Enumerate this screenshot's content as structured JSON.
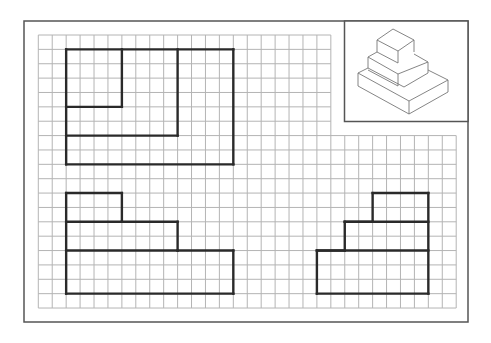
{
  "sheet": {
    "frame": {
      "x": 24,
      "y": 21,
      "width": 444,
      "height": 301,
      "stroke": "#555555"
    },
    "grid": {
      "origin_x": 38.3,
      "origin_y": 35,
      "cell_w": 13.93,
      "cell_h": 14.37,
      "cols": 30,
      "rows": 19,
      "line_color": "#b4b4b4",
      "cutout": {
        "col_start": 22,
        "row_end": 7
      }
    },
    "drawing_line_color": "#2a2a2a",
    "iso_box": {
      "x": 344.5,
      "y": 21,
      "width": 123.5,
      "height": 100.5,
      "stroke": "#555555",
      "line_color": "#777777"
    }
  },
  "views": [
    {
      "name": "top-view",
      "segments_grid": [
        [
          [
            2,
            1
          ],
          [
            14,
            1
          ]
        ],
        [
          [
            14,
            1
          ],
          [
            14,
            9
          ]
        ],
        [
          [
            14,
            9
          ],
          [
            2,
            9
          ]
        ],
        [
          [
            2,
            9
          ],
          [
            2,
            1
          ]
        ],
        [
          [
            6,
            1
          ],
          [
            6,
            5
          ]
        ],
        [
          [
            6,
            5
          ],
          [
            2,
            5
          ]
        ],
        [
          [
            10,
            1
          ],
          [
            10,
            7
          ]
        ],
        [
          [
            10,
            7
          ],
          [
            2,
            7
          ]
        ]
      ]
    },
    {
      "name": "front-view",
      "segments_grid": [
        [
          [
            2,
            11
          ],
          [
            6,
            11
          ]
        ],
        [
          [
            6,
            11
          ],
          [
            6,
            13
          ]
        ],
        [
          [
            6,
            13
          ],
          [
            10,
            13
          ]
        ],
        [
          [
            10,
            13
          ],
          [
            10,
            15
          ]
        ],
        [
          [
            10,
            15
          ],
          [
            14,
            15
          ]
        ],
        [
          [
            14,
            15
          ],
          [
            14,
            18
          ]
        ],
        [
          [
            14,
            18
          ],
          [
            2,
            18
          ]
        ],
        [
          [
            2,
            18
          ],
          [
            2,
            11
          ]
        ],
        [
          [
            2,
            13
          ],
          [
            6,
            13
          ]
        ],
        [
          [
            2,
            15
          ],
          [
            10,
            15
          ]
        ]
      ]
    },
    {
      "name": "side-view",
      "segments_grid": [
        [
          [
            24,
            11
          ],
          [
            28,
            11
          ]
        ],
        [
          [
            28,
            11
          ],
          [
            28,
            18
          ]
        ],
        [
          [
            28,
            18
          ],
          [
            20,
            18
          ]
        ],
        [
          [
            20,
            18
          ],
          [
            20,
            15
          ]
        ],
        [
          [
            20,
            15
          ],
          [
            22,
            15
          ]
        ],
        [
          [
            22,
            15
          ],
          [
            22,
            13
          ]
        ],
        [
          [
            22,
            13
          ],
          [
            24,
            13
          ]
        ],
        [
          [
            24,
            13
          ],
          [
            24,
            11
          ]
        ],
        [
          [
            22,
            13
          ],
          [
            28,
            13
          ]
        ],
        [
          [
            20,
            15
          ],
          [
            28,
            15
          ]
        ]
      ]
    }
  ],
  "isometric": {
    "name": "stepped-pyramid-isometric",
    "polylines": [
      [
        [
          393,
          29
        ],
        [
          414,
          40
        ],
        [
          398,
          51
        ],
        [
          377,
          40
        ],
        [
          393,
          29
        ]
      ],
      [
        [
          377,
          40
        ],
        [
          377,
          52
        ]
      ],
      [
        [
          398,
          51
        ],
        [
          398,
          63
        ]
      ],
      [
        [
          414,
          40
        ],
        [
          414,
          52
        ]
      ],
      [
        [
          377,
          52
        ],
        [
          368,
          57
        ],
        [
          368,
          68
        ],
        [
          404,
          87
        ],
        [
          428,
          73
        ],
        [
          428,
          62
        ],
        [
          414,
          54
        ]
      ],
      [
        [
          368,
          57
        ],
        [
          398,
          74
        ],
        [
          428,
          62
        ]
      ],
      [
        [
          398,
          63
        ],
        [
          377,
          52
        ]
      ],
      [
        [
          398,
          74
        ],
        [
          398,
          86
        ]
      ],
      [
        [
          368,
          68
        ],
        [
          358,
          73
        ],
        [
          358,
          86
        ],
        [
          409,
          114
        ],
        [
          448,
          92
        ],
        [
          448,
          80
        ],
        [
          428,
          70
        ]
      ],
      [
        [
          358,
          73
        ],
        [
          409,
          101
        ],
        [
          448,
          80
        ]
      ],
      [
        [
          409,
          101
        ],
        [
          409,
          114
        ]
      ],
      [
        [
          398,
          86
        ],
        [
          368,
          70
        ]
      ]
    ]
  }
}
